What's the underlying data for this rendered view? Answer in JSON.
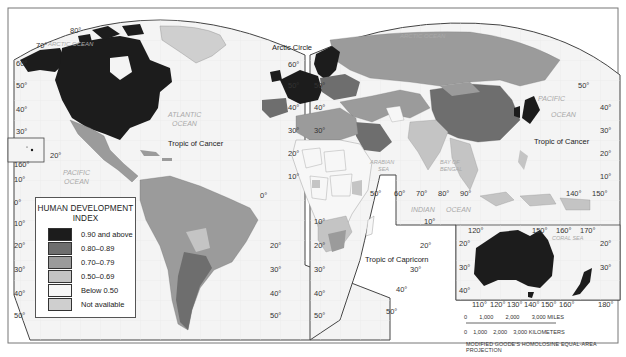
{
  "map": {
    "title": "Human Development Index world map",
    "projection": "MODIFIED GOODE'S HOMOLOSINE EQUAL-AREA PROJECTION",
    "colors": {
      "frame": "#555555",
      "ocean": "#f4f4f4",
      "hdi_090_above": "#1c1c1c",
      "hdi_080_089": "#6e6e6e",
      "hdi_070_079": "#9b9b9b",
      "hdi_050_069": "#c4c4c4",
      "hdi_below_050": "#f7f7f7",
      "not_available": "#cfcfcf"
    }
  },
  "legend": {
    "title_line1": "HUMAN DEVELOPMENT",
    "title_line2": "INDEX",
    "items": [
      {
        "label": "0.90 and above",
        "color": "#1c1c1c"
      },
      {
        "label": "0.80–0.89",
        "color": "#6e6e6e"
      },
      {
        "label": "0.70–0.79",
        "color": "#9b9b9b"
      },
      {
        "label": "0.50–0.69",
        "color": "#c4c4c4"
      },
      {
        "label": "Below 0.50",
        "color": "#f7f7f7"
      },
      {
        "label": "Not available",
        "color": "#cfcfcf"
      }
    ]
  },
  "labels": {
    "arctic_ocean_west": "ARCTIC OCEAN",
    "arctic_ocean_east": "ARCTIC OCEAN",
    "arctic_circle": "Arctic Circle",
    "atlantic_ocean_1": "ATLANTIC",
    "atlantic_ocean_2": "OCEAN",
    "pacific_ocean_west_1": "PACIFIC",
    "pacific_ocean_west_2": "OCEAN",
    "pacific_ocean_east_1": "PACIFIC",
    "pacific_ocean_east_2": "OCEAN",
    "indian_ocean_1": "INDIAN",
    "indian_ocean_2": "OCEAN",
    "arabian_sea_1": "ARABIAN",
    "arabian_sea_2": "SEA",
    "bay_of_bengal_1": "BAY OF",
    "bay_of_bengal_2": "BENGAL",
    "coral_sea": "CORAL SEA",
    "tropic_of_cancer_west": "Tropic of Cancer",
    "tropic_of_cancer_east": "Tropic of Cancer",
    "tropic_of_capricorn": "Tropic of Capricorn"
  },
  "ticks": {
    "west_left": [
      "70°",
      "60°",
      "50°",
      "40°",
      "30°",
      "20°",
      "160°",
      "10°",
      "0°",
      "10°",
      "20°",
      "30°",
      "40°",
      "50°"
    ],
    "west_top": "80°",
    "atlantic_right": [
      "60°",
      "50°",
      "40°",
      "30°",
      "20°",
      "10°",
      "0°",
      "10°",
      "20°",
      "30°",
      "40°",
      "50°"
    ],
    "europe_left": [
      "50°",
      "40°",
      "30°"
    ],
    "africa_left": [
      "10°",
      "20°",
      "30°",
      "40°",
      "50°"
    ],
    "indian_lon": [
      "50°",
      "60°",
      "70°",
      "80°",
      "90°"
    ],
    "indian_lat": [
      "10°",
      "20°",
      "30°",
      "40°",
      "50°"
    ],
    "pacific_right": [
      "50°",
      "40°",
      "30°",
      "20°",
      "10°"
    ],
    "pacific_bottom": [
      "140°",
      "150°"
    ],
    "aus_top": [
      "120°",
      "150°",
      "160°",
      "170°"
    ],
    "aus_left": [
      "20°",
      "30°",
      "40°"
    ],
    "aus_right": [
      "20°",
      "30°"
    ],
    "aus_bottom": [
      "110°",
      "120°",
      "130°",
      "140°",
      "150°",
      "160°",
      "180°"
    ]
  },
  "scale": {
    "miles": [
      "0",
      "1,000",
      "2,000",
      "3,000 MILES"
    ],
    "km": [
      "0",
      "1,000",
      "2,000",
      "3,000 KILOMETERS"
    ]
  }
}
